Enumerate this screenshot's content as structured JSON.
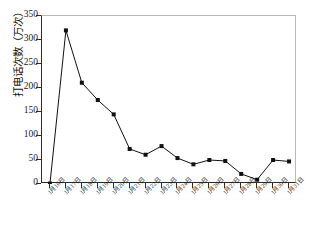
{
  "chart_data": {
    "type": "line",
    "title": "",
    "xlabel": "",
    "ylabel": "打电话次数（万次）",
    "ylim": [
      0,
      350
    ],
    "ytick_labels": [
      "0",
      "50",
      "100",
      "150",
      "200",
      "250",
      "300",
      "350"
    ],
    "ytick_values": [
      0,
      50,
      100,
      150,
      200,
      250,
      300,
      350
    ],
    "grid": false,
    "legend": false,
    "marker": "square",
    "line_color": "#111111",
    "marker_color": "#111111",
    "categories": [
      "1月16日",
      "1月17日",
      "1月18日",
      "1月19日",
      "1月20日",
      "1月21日",
      "1月22日",
      "1月23日",
      "1月24日",
      "1月25日",
      "1月26日",
      "1月27日",
      "1月28日",
      "1月29日",
      "1月30日",
      "1月31日"
    ],
    "values": [
      1,
      320,
      211,
      175,
      145,
      73,
      61,
      79,
      54,
      41,
      50,
      48,
      21,
      9,
      50,
      47
    ]
  }
}
